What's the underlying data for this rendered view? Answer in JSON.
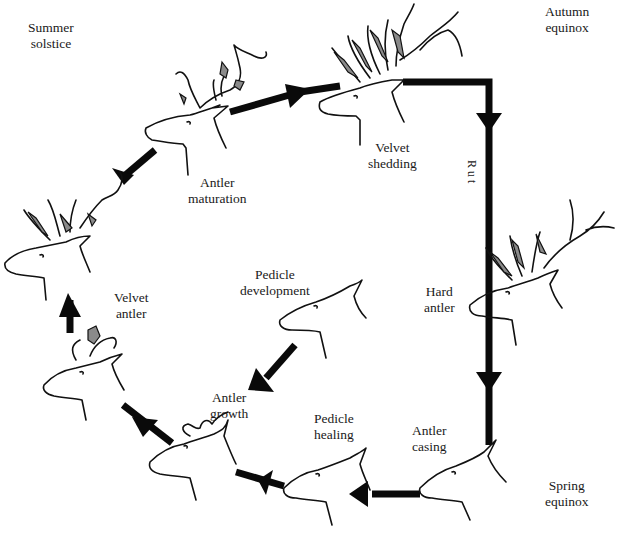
{
  "diagram": {
    "season_labels": {
      "summer": [
        "Summer",
        "solstice"
      ],
      "autumn": [
        "Autumn",
        "equinox"
      ],
      "spring": [
        "Spring",
        "equinox"
      ]
    },
    "rut_label": "Rut",
    "stages": [
      {
        "id": "pedicle-development",
        "lines": [
          "Pedicle",
          "development"
        ]
      },
      {
        "id": "antler-growth",
        "lines": [
          "Antler",
          "growth"
        ]
      },
      {
        "id": "velvet-antler",
        "lines": [
          "Velvet",
          "antler"
        ]
      },
      {
        "id": "antler-maturation",
        "lines": [
          "Antler",
          "maturation"
        ]
      },
      {
        "id": "velvet-shedding",
        "lines": [
          "Velvet",
          "shedding"
        ]
      },
      {
        "id": "hard-antler",
        "lines": [
          "Hard",
          "antler"
        ]
      },
      {
        "id": "antler-casting",
        "lines": [
          "Antler",
          "casing"
        ]
      },
      {
        "id": "pedicle-healing",
        "lines": [
          "Pedicle",
          "healing"
        ]
      }
    ],
    "colors": {
      "ink": "#0a0a0a",
      "velvet": "#8a8a8a",
      "background": "#ffffff"
    }
  }
}
